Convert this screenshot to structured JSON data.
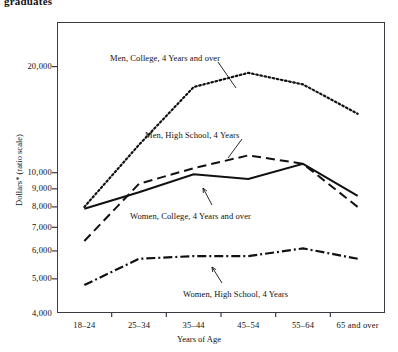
{
  "page": {
    "cut_off_heading": "graduates"
  },
  "axes": {
    "y_title": "Dollars* (ratio scale)",
    "x_title": "Years of Age",
    "y_ticks": [
      "20,000",
      "10,000",
      "9,000",
      "8,000",
      "7,000",
      "6,000",
      "5,000",
      "4,000"
    ],
    "x_ticks": [
      "18–24",
      "25–34",
      "35–44",
      "45–54",
      "55–64",
      "65 and over"
    ]
  },
  "annotations": [
    {
      "text": "Men, College, 4 Years and over",
      "x": 110,
      "y": 53
    },
    {
      "text": "Men, High School, 4 Years",
      "x": 145,
      "y": 130
    },
    {
      "text": "Women, College, 4 Years and over",
      "x": 130,
      "y": 211
    },
    {
      "text": "Women, High School, 4 Years",
      "x": 183,
      "y": 289
    }
  ],
  "chart_data": {
    "type": "line",
    "title": "graduates",
    "xlabel": "Years of Age",
    "ylabel": "Dollars* (ratio scale)",
    "scale": "log",
    "ylim": [
      4000,
      22000
    ],
    "grid": false,
    "legend": "annotations-inline",
    "categories": [
      "18–24",
      "25–34",
      "35–44",
      "45–54",
      "55–64",
      "65 and over"
    ],
    "series": [
      {
        "name": "Men, College, 4 Years and over",
        "style": "dotted",
        "values": [
          8000,
          12000,
          17500,
          19200,
          17800,
          14700
        ]
      },
      {
        "name": "Men, High School, 4 Years",
        "style": "dashed",
        "values": [
          6400,
          9300,
          10300,
          11200,
          10600,
          8000
        ]
      },
      {
        "name": "Women, College, 4 Years and over",
        "style": "solid",
        "values": [
          7900,
          8800,
          9900,
          9600,
          10600,
          8600
        ]
      },
      {
        "name": "Women, High School, 4 Years",
        "style": "dash-dot",
        "values": [
          4800,
          5700,
          5800,
          5800,
          6100,
          5700
        ]
      }
    ]
  },
  "colors": {
    "ink": "#111111",
    "frame": "#3b3b44",
    "background": "#ffffff"
  }
}
